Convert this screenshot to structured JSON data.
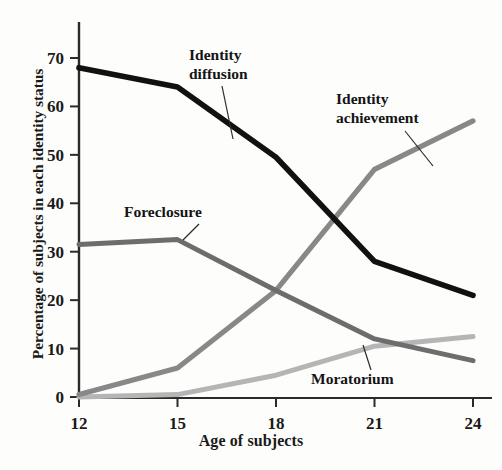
{
  "chart_data": {
    "type": "line",
    "title": "",
    "xlabel": "Age of subjects",
    "ylabel": "Percentage of subjects in each identity status",
    "x": [
      12,
      15,
      18,
      21,
      24
    ],
    "xticklabels": [
      "12",
      "15",
      "18",
      "21",
      "24"
    ],
    "yticklabels": [
      "0",
      "10",
      "20",
      "30",
      "40",
      "50",
      "60",
      "70"
    ],
    "xlim": [
      12,
      24
    ],
    "ylim": [
      0,
      73
    ],
    "grid": false,
    "legend": "inline-annotations",
    "series": [
      {
        "name": "Identity diffusion",
        "color": "#111111",
        "width": 5.6,
        "values": [
          68,
          64,
          49.5,
          28,
          21
        ]
      },
      {
        "name": "Foreclosure",
        "color": "#6d6d6d",
        "width": 5.0,
        "values": [
          31.5,
          32.5,
          22,
          12,
          7.5
        ]
      },
      {
        "name": "Identity achievement",
        "color": "#888888",
        "width": 5.2,
        "values": [
          0.5,
          6,
          22,
          47,
          57
        ]
      },
      {
        "name": "Moratorium",
        "color": "#b5b5b5",
        "width": 5.0,
        "values": [
          0,
          0.5,
          4.5,
          10.5,
          12.5
        ]
      }
    ],
    "annotations": [
      {
        "label_line1": "Identity",
        "label_line2": "diffusion",
        "series": "Identity diffusion"
      },
      {
        "label_line1": "Identity",
        "label_line2": "achievement",
        "series": "Identity achievement"
      },
      {
        "label_line1": "Foreclosure",
        "label_line2": "",
        "series": "Foreclosure"
      },
      {
        "label_line1": "Moratorium",
        "label_line2": "",
        "series": "Moratorium"
      }
    ]
  }
}
